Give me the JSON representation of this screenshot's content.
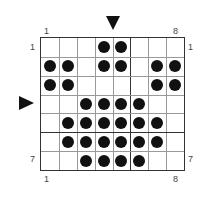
{
  "grid": {
    "cols": 8,
    "rows": 7,
    "thick_col_after": 5,
    "thick_row_after": 5,
    "filled": [
      [
        0,
        0,
        0,
        1,
        1,
        0,
        0,
        0
      ],
      [
        1,
        1,
        0,
        1,
        1,
        0,
        1,
        1
      ],
      [
        1,
        1,
        0,
        0,
        0,
        0,
        1,
        1
      ],
      [
        0,
        0,
        1,
        1,
        1,
        1,
        0,
        0
      ],
      [
        0,
        1,
        1,
        1,
        1,
        1,
        1,
        0
      ],
      [
        0,
        1,
        1,
        1,
        1,
        1,
        1,
        0
      ],
      [
        0,
        0,
        1,
        1,
        1,
        1,
        0,
        0
      ]
    ]
  },
  "labels": {
    "top_left": "1",
    "top_right": "8",
    "bottom_left": "1",
    "bottom_right": "8",
    "left_top": "1",
    "left_bottom": "7",
    "right_top": "1",
    "right_bottom": "7"
  },
  "markers": {
    "top_arrow": "arrow-down between columns 4 and 5",
    "left_arrow": "arrow-right between rows 3 and 4"
  },
  "colors": {
    "dot": "#111111",
    "grid_line": "#999999",
    "grid_border": "#333333"
  }
}
